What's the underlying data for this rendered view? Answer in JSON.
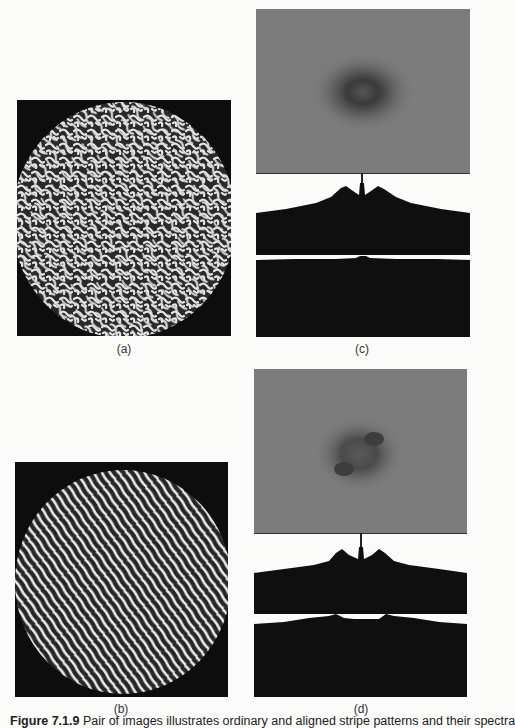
{
  "figure": {
    "panels": [
      {
        "id": "a",
        "label": "(a)",
        "type": "image",
        "description": "disordered labyrinthine stripe pattern in circular domain"
      },
      {
        "id": "b",
        "label": "(b)",
        "type": "image",
        "description": "aligned diagonal stripe pattern in circular domain"
      },
      {
        "id": "c",
        "label": "(c)",
        "type": "spectrum-with-profiles",
        "description": "Fourier spectrum (diffuse ring) with two intensity profile plots"
      },
      {
        "id": "d",
        "label": "(d)",
        "type": "spectrum-with-profiles",
        "description": "Fourier spectrum (anisotropic ring) with two intensity profile plots"
      }
    ],
    "caption": {
      "number": "Figure 7.1.9",
      "text": "Pair of images illustrates ordinary and aligned stripe patterns and their spectra"
    }
  },
  "colors": {
    "background": "#fbfbfa",
    "texture_dark": "#0d0d0d",
    "texture_light": "#e8e8e8",
    "spectrum_gray": "#7a7a7a",
    "profile_fill": "#0f0f0f"
  }
}
